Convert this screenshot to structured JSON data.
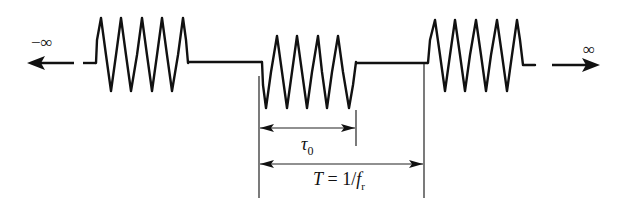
{
  "diagram": {
    "type": "pulsed-sinusoid-train",
    "colors": {
      "ink": "#111111",
      "background": "#ffffff"
    },
    "labels": {
      "left_infinity": "−∞",
      "right_infinity": "∞",
      "pulse_width_symbol": "τ",
      "pulse_width_subscript": "0",
      "period_lhs": "T",
      "period_eq": " = 1/",
      "period_f": "f",
      "period_subscript": "r"
    },
    "bursts": [
      {
        "name": "burst-left",
        "start_x": 96,
        "end_x": 189,
        "cycles": 5
      },
      {
        "name": "burst-center",
        "start_x": 262,
        "end_x": 356,
        "cycles": 5
      },
      {
        "name": "burst-right",
        "start_x": 428,
        "end_x": 523,
        "cycles": 5
      }
    ],
    "dimensions": {
      "pulse_width": {
        "from_x": 259,
        "to_x": 356,
        "y": 128
      },
      "period": {
        "from_x": 259,
        "to_x": 424,
        "y": 164
      }
    }
  }
}
